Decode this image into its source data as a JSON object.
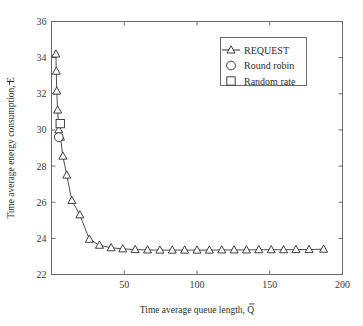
{
  "chart_data": {
    "type": "line",
    "title": "",
    "xlabel": "Time average queue length, Q̄",
    "ylabel": "Time average energy consumption, Ē",
    "xlim": [
      0,
      200
    ],
    "ylim": [
      22,
      36
    ],
    "xticks": [
      50,
      100,
      150,
      200
    ],
    "xticklabels": [
      "50",
      "100",
      "150",
      "200"
    ],
    "yticks": [
      22,
      24,
      26,
      28,
      30,
      32,
      34,
      36
    ],
    "yticklabels": [
      "22",
      "24",
      "26",
      "28",
      "30",
      "32",
      "34",
      "36"
    ],
    "grid": false,
    "legend_position": "upper right",
    "series": [
      {
        "name": "REQUEST",
        "marker": "triangle",
        "linestyle": "solid",
        "color": "#2b2b2b",
        "x": [
          3.0,
          3.3,
          3.6,
          4.2,
          5.0,
          6.2,
          7.8,
          10.5,
          14.0,
          19.5,
          26.0,
          33.0,
          41.0,
          49.0,
          57.5,
          66.0,
          74.5,
          83.0,
          91.5,
          100.0,
          108.5,
          117.0,
          125.5,
          134.0,
          142.5,
          151.0,
          159.5,
          168.0,
          177.0,
          187.0
        ],
        "y": [
          34.2,
          33.25,
          32.15,
          31.1,
          30.0,
          29.6,
          28.55,
          27.5,
          26.1,
          25.3,
          23.95,
          23.62,
          23.48,
          23.42,
          23.38,
          23.36,
          23.35,
          23.35,
          23.35,
          23.35,
          23.35,
          23.36,
          23.36,
          23.36,
          23.37,
          23.37,
          23.37,
          23.38,
          23.38,
          23.4
        ]
      },
      {
        "name": "Round robin",
        "marker": "circle",
        "linestyle": "none",
        "color": "#2b2b2b",
        "x": [
          5.0
        ],
        "y": [
          29.6
        ]
      },
      {
        "name": "Random rate",
        "marker": "square",
        "linestyle": "none",
        "color": "#2b2b2b",
        "x": [
          6.0
        ],
        "y": [
          30.35
        ]
      }
    ],
    "legend_entries": [
      {
        "label": "REQUEST",
        "marker": "triangle",
        "has_line": true
      },
      {
        "label": "Round robin",
        "marker": "circle",
        "has_line": false
      },
      {
        "label": "Random rate",
        "marker": "square",
        "has_line": false
      }
    ]
  }
}
